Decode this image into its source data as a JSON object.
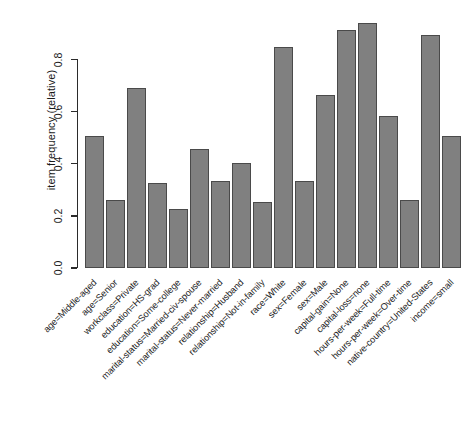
{
  "chart_data": {
    "type": "bar",
    "title": "",
    "subtitle": "",
    "xlabel": "",
    "ylabel": "item frequency (relative)",
    "ylim": [
      0.0,
      0.96
    ],
    "grid": false,
    "legend": null,
    "bar_color": "#808080",
    "bar_edge_color": "#4a4a4a",
    "ytick_labels": [
      "0.0",
      "0.2",
      "0.4",
      "0.6",
      "0.8"
    ],
    "ytick_values": [
      0.0,
      0.2,
      0.4,
      0.6,
      0.8
    ],
    "categories": [
      "age=Middle-aged",
      "age=Senior",
      "workclass=Private",
      "education=HS-grad",
      "education=Some-college",
      "marital-status=Married-civ-spouse",
      "marital-status=Never-married",
      "relationship=Husband",
      "relationship=Not-in-family",
      "race=White",
      "sex=Female",
      "sex=Male",
      "capital-gain=None",
      "capital-loss=none",
      "hours-per-week=Full-time",
      "hours-per-week=Over-time",
      "native-country=United-States",
      "income=small"
    ],
    "values": [
      0.505,
      0.26,
      0.69,
      0.325,
      0.225,
      0.455,
      0.335,
      0.405,
      0.255,
      0.85,
      0.335,
      0.665,
      0.915,
      0.94,
      0.585,
      0.26,
      0.895,
      0.505
    ]
  }
}
